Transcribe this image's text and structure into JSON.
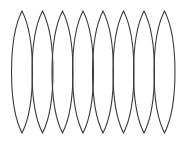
{
  "diagram": {
    "title": "",
    "shape_type": "lens",
    "count": 8,
    "stroke_color": "#3a3a3a",
    "background_color": "#ffffff",
    "stroke_width": 1.1,
    "top_y": 11,
    "bottom_y": 133,
    "half_width": 10.5,
    "lenses": [
      {
        "cx": 22
      },
      {
        "cx": 42.5
      },
      {
        "cx": 62.5
      },
      {
        "cx": 83
      },
      {
        "cx": 103
      },
      {
        "cx": 123.5
      },
      {
        "cx": 144
      },
      {
        "cx": 164.5
      }
    ]
  }
}
